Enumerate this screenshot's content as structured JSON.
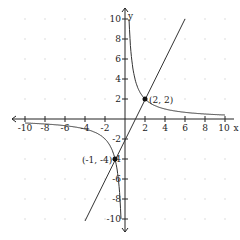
{
  "chart_data": {
    "type": "line",
    "title": "",
    "xlabel": "x",
    "ylabel": "y",
    "xlim": [
      -10,
      10
    ],
    "ylim": [
      -10,
      10
    ],
    "grid": "dots",
    "x_ticks": [
      "-10",
      "-8",
      "-6",
      "-4",
      "-2",
      "2",
      "4",
      "6",
      "8",
      "10"
    ],
    "y_ticks": [
      "10",
      "8",
      "6",
      "4",
      "2",
      "-2",
      "-4",
      "-6",
      "-8",
      "-10"
    ],
    "series": [
      {
        "name": "hyperbola",
        "equation": "y = 4/x"
      },
      {
        "name": "line",
        "equation": "y = 2x - 2"
      }
    ],
    "points": [
      {
        "x": 2,
        "y": 2,
        "label": "(2, 2)"
      },
      {
        "x": -1,
        "y": -4,
        "label": "(-1, -4)"
      }
    ]
  },
  "labels": {
    "x_axis": "x",
    "y_axis": "y",
    "x_ticks": [
      "-10",
      "-8",
      "-6",
      "-4",
      "-2",
      "2",
      "4",
      "6",
      "8",
      "10"
    ],
    "y_pos_ticks": [
      "10",
      "8",
      "6",
      "4",
      "2"
    ],
    "y_neg_ticks": [
      "-2",
      "-4",
      "-6",
      "-8",
      "-10"
    ],
    "point1": "(2, 2)",
    "point2": "(-1, -4)"
  }
}
